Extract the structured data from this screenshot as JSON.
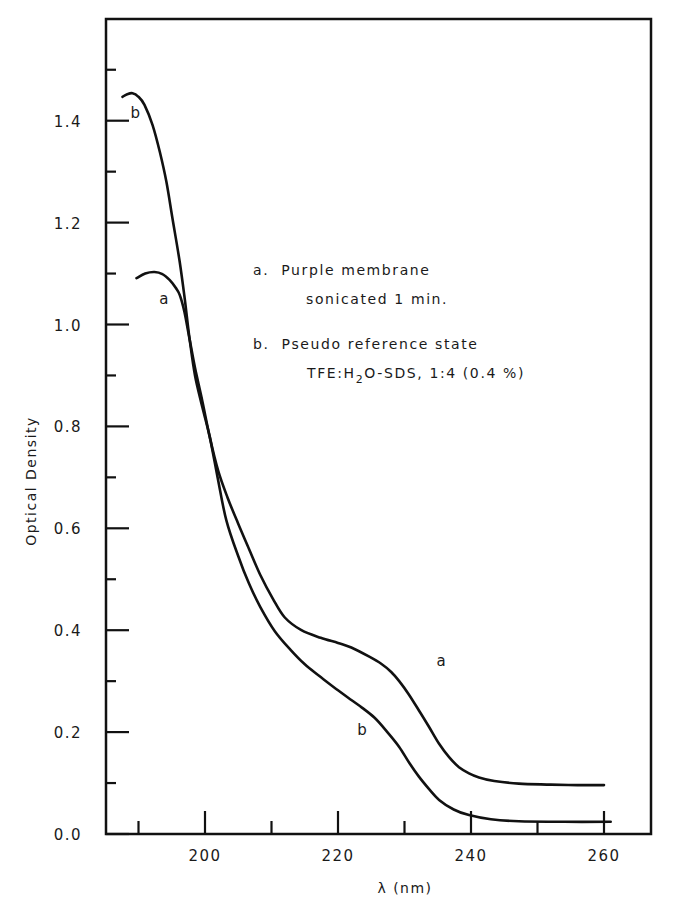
{
  "chart_data": {
    "type": "line",
    "title": "",
    "xlabel": "λ (nm)",
    "ylabel": "Optical Density",
    "xlim": [
      185,
      268
    ],
    "ylim": [
      0.0,
      1.6
    ],
    "grid": false,
    "x_major_ticks": [
      200,
      220,
      240,
      260
    ],
    "x_minor_ticks": [
      190,
      210,
      230,
      250
    ],
    "x_tick_labels": [
      "200",
      "220",
      "240",
      "260"
    ],
    "y_major_ticks": [
      0.0,
      0.2,
      0.4,
      0.6,
      0.8,
      1.0,
      1.2,
      1.4
    ],
    "y_minor_ticks": [
      0.1,
      0.3,
      0.5,
      0.7,
      0.9,
      1.1,
      1.3,
      1.5
    ],
    "y_tick_labels": [
      "0.0",
      "0.2",
      "0.4",
      "0.6",
      "0.8",
      "1.0",
      "1.2",
      "1.4"
    ],
    "series": [
      {
        "name": "a",
        "label": "a",
        "label_at": [
          193.8,
          1.04
        ],
        "label2_at": [
          235.5,
          0.33
        ],
        "x": [
          189.7,
          191.0,
          192.4,
          193.6,
          194.7,
          195.6,
          196.2,
          196.9,
          197.7,
          198.5,
          199.6,
          200.7,
          202.0,
          203.4,
          204.9,
          206.6,
          208.3,
          210.2,
          212.0,
          214.5,
          217.4,
          220.0,
          222.0,
          224.7,
          226.5,
          228.0,
          229.2,
          230.6,
          232.2,
          233.7,
          235.2,
          236.7,
          238.2,
          239.7,
          241.2,
          243.5,
          247.2,
          252.0,
          256.0,
          260.0
        ],
        "y": [
          1.091,
          1.1,
          1.103,
          1.099,
          1.087,
          1.072,
          1.058,
          1.025,
          0.97,
          0.915,
          0.85,
          0.78,
          0.712,
          0.66,
          0.612,
          0.56,
          0.509,
          0.462,
          0.425,
          0.4,
          0.385,
          0.375,
          0.366,
          0.348,
          0.334,
          0.318,
          0.3,
          0.275,
          0.242,
          0.21,
          0.177,
          0.151,
          0.131,
          0.119,
          0.111,
          0.104,
          0.099,
          0.097,
          0.096,
          0.096
        ]
      },
      {
        "name": "b",
        "label": "b",
        "label_at": [
          189.5,
          1.405
        ],
        "label2_at": [
          223.6,
          0.195
        ],
        "x": [
          187.6,
          188.3,
          189.1,
          190.0,
          190.9,
          192.1,
          193.2,
          194.2,
          195.1,
          196.2,
          197.0,
          197.7,
          198.5,
          199.6,
          200.7,
          201.9,
          203.2,
          205.0,
          206.6,
          208.3,
          210.5,
          212.9,
          215.0,
          217.4,
          220.0,
          222.0,
          223.6,
          225.5,
          227.3,
          229.2,
          230.7,
          232.2,
          233.7,
          235.2,
          237.4,
          239.7,
          243.0,
          247.2,
          254.0,
          261.0
        ],
        "y": [
          1.447,
          1.452,
          1.454,
          1.447,
          1.431,
          1.392,
          1.339,
          1.28,
          1.209,
          1.123,
          1.045,
          0.97,
          0.9,
          0.838,
          0.78,
          0.7,
          0.616,
          0.545,
          0.492,
          0.446,
          0.398,
          0.361,
          0.333,
          0.308,
          0.282,
          0.263,
          0.248,
          0.228,
          0.202,
          0.171,
          0.14,
          0.112,
          0.088,
          0.067,
          0.048,
          0.037,
          0.029,
          0.025,
          0.024,
          0.024
        ]
      }
    ],
    "legend": {
      "placement": "center-right",
      "entries": [
        {
          "key": "a.",
          "line1": "Purple membrane",
          "line2": "sonicated 1 min."
        },
        {
          "key": "b.",
          "line1": "Pseudo reference state",
          "line2_prefix": "TFE:H",
          "line2_sub": "2",
          "line2_suffix": "O-SDS, 1:4 (0.4 %)"
        }
      ]
    }
  }
}
